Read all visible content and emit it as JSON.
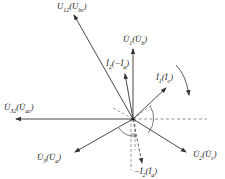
{
  "diagram": {
    "type": "phasor-diagram",
    "origin": [
      133,
      119
    ],
    "vectors": [
      {
        "id": "U12",
        "label": "U̇12(U̇bc)",
        "tip": [
          74,
          14
        ],
        "style": "solid"
      },
      {
        "id": "U1",
        "label": "U̇1(U̇b)",
        "tip": [
          133,
          49
        ],
        "style": "solid"
      },
      {
        "id": "I2",
        "label": "İ2(−İa)",
        "tip": [
          125,
          74
        ],
        "style": "solid"
      },
      {
        "id": "I1",
        "label": "İ1(İc)",
        "tip": [
          166,
          88
        ],
        "style": "solid"
      },
      {
        "id": "U32",
        "label": "U̇32(U̇ac)",
        "tip": [
          15,
          119
        ],
        "style": "solid"
      },
      {
        "id": "U3",
        "label": "U̇3(U̇a)",
        "tip": [
          74,
          153
        ],
        "style": "solid"
      },
      {
        "id": "U2",
        "label": "U̇2(U̇c)",
        "tip": [
          187,
          153
        ],
        "style": "solid"
      },
      {
        "id": "negI2",
        "label": "−İ2(İa)",
        "tip": [
          142,
          164
        ],
        "style": "dashed"
      }
    ],
    "rotation_label": "rotation-direction",
    "colors": {
      "line": "#333333",
      "dash": "#777777",
      "background": "#ffffff"
    }
  },
  "labels": {
    "u12_main": "U",
    "u12_sub": "12",
    "u12_paren": "(U",
    "u12_psub": "bc",
    "u12_close": ")",
    "u1": "U̇",
    "u1_sub": "1",
    "u1_paren": "(U̇",
    "u1_psub": "b",
    "u1_close": ")",
    "i2": "İ",
    "i2_sub": "2",
    "i2_paren": "(−İ",
    "i2_psub": "a",
    "i2_close": ")",
    "i1": "İ",
    "i1_sub": "1",
    "i1_paren": "(İ",
    "i1_psub": "c",
    "i1_close": ")",
    "u32": "U̇",
    "u32_sub": "32",
    "u32_paren": "(U̇",
    "u32_psub": "ac",
    "u32_close": ")",
    "u3": "U̇",
    "u3_sub": "3",
    "u3_paren": "(U̇",
    "u3_psub": "a",
    "u3_close": ")",
    "u2": "U̇",
    "u2_sub": "2",
    "u2_paren": "(U̇",
    "u2_psub": "c",
    "u2_close": ")",
    "negi2": "−İ",
    "negi2_sub": "2",
    "negi2_paren": "(İ",
    "negi2_psub": "a",
    "negi2_close": ")"
  }
}
